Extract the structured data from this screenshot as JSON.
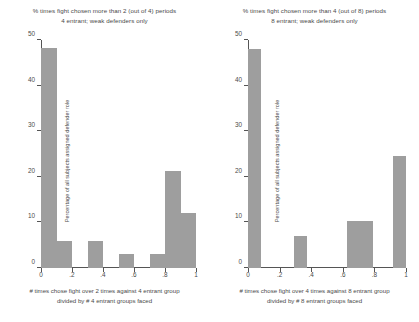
{
  "chart_data": [
    {
      "id": "left",
      "type": "bar",
      "title": "% times fight chosen more than 2 (out of 4) periods",
      "subtitle": "4 entrant; weak defenders only",
      "ylabel": "Percentage of all subjects assigned defender role",
      "xlabel": "# times chose fight over 2 times against 4 entrant group",
      "xlabel_line2": "divided by # 4 entrant groups faced",
      "xlim": [
        0,
        1
      ],
      "ylim": [
        0,
        50
      ],
      "xticks": [
        0,
        0.2,
        0.4,
        0.6,
        0.8,
        1
      ],
      "xtick_labels": [
        "0",
        ".2",
        ".4",
        ".6",
        ".8",
        "1"
      ],
      "yticks": [
        0,
        10,
        20,
        30,
        40,
        50
      ],
      "ytick_labels": [
        "0",
        "10",
        "20",
        "30",
        "40",
        "50"
      ],
      "grid": false,
      "legend": "none",
      "bars": [
        {
          "x0": 0.0,
          "x1": 0.1,
          "value": 48.3
        },
        {
          "x0": 0.1,
          "x1": 0.2,
          "value": 6.0
        },
        {
          "x0": 0.3,
          "x1": 0.4,
          "value": 6.0
        },
        {
          "x0": 0.5,
          "x1": 0.6,
          "value": 3.0
        },
        {
          "x0": 0.7,
          "x1": 0.8,
          "value": 3.0
        },
        {
          "x0": 0.8,
          "x1": 0.9,
          "value": 21.2
        },
        {
          "x0": 0.9,
          "x1": 1.0,
          "value": 12.1
        }
      ]
    },
    {
      "id": "right",
      "type": "bar",
      "title": "% times fight chosen more than 4 (out of 8) periods",
      "subtitle": "8 entrant; weak defenders only",
      "ylabel": "Percentage of all subjects assigned defender role",
      "xlabel": "# times chose fight over 4 times against 8 entrant group",
      "xlabel_line2": "divided by # 8 entrant groups faced",
      "xlim": [
        0,
        1
      ],
      "ylim": [
        0,
        50
      ],
      "xticks": [
        0,
        0.2,
        0.4,
        0.6,
        0.8,
        1
      ],
      "xtick_labels": [
        "0",
        ".2",
        ".4",
        ".6",
        ".8",
        "1"
      ],
      "yticks": [
        0,
        10,
        20,
        30,
        40,
        50
      ],
      "ytick_labels": [
        "0",
        "10",
        "20",
        "30",
        "40",
        "50"
      ],
      "grid": false,
      "legend": "none",
      "bars": [
        {
          "x0": 0.0,
          "x1": 0.085,
          "value": 48.0
        },
        {
          "x0": 0.29,
          "x1": 0.375,
          "value": 7.0
        },
        {
          "x0": 0.625,
          "x1": 0.79,
          "value": 10.3
        },
        {
          "x0": 0.915,
          "x1": 1.0,
          "value": 24.5
        }
      ]
    }
  ],
  "colors": {
    "bar_fill": "#9e9e9e",
    "axis": "#555555",
    "text": "#4a4a4a",
    "background": "#ffffff"
  }
}
